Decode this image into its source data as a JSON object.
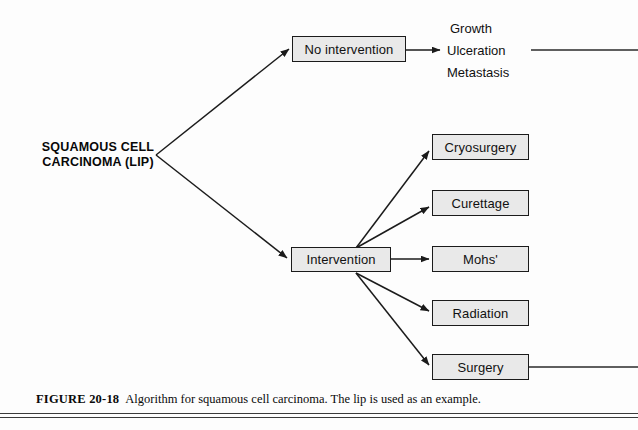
{
  "figure": {
    "label": "FIGURE 20-18",
    "text": "Algorithm for squamous cell carcinoma. The lip is used as an example."
  },
  "root": {
    "line1": "SQUAMOUS CELL",
    "line2": "CARCINOMA (LIP)"
  },
  "branches": {
    "no_intervention": "No intervention",
    "intervention": "Intervention"
  },
  "outcomes": [
    "Growth",
    "Ulceration",
    "Metastasis"
  ],
  "treatments": [
    "Cryosurgery",
    "Curettage",
    "Mohs'",
    "Radiation",
    "Surgery"
  ],
  "colors": {
    "box_fill": "#e9e9e9",
    "box_border": "#1b1b1b",
    "line": "#1b1b1b",
    "text": "#111111",
    "background": "#fdfdfd"
  }
}
